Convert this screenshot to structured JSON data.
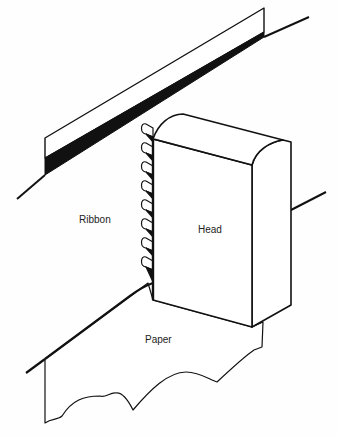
{
  "diagram": {
    "type": "technical-illustration",
    "labels": {
      "ribbon": "Ribbon",
      "head": "Head",
      "paper": "Paper"
    },
    "pin_count": 8,
    "colors": {
      "ink": "#111111",
      "background": "#fefefe"
    }
  }
}
